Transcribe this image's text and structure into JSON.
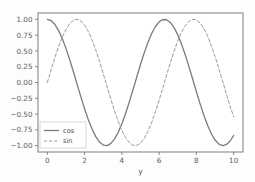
{
  "figure": {
    "background_color": "#fdfdfd",
    "axes_background_color": "#ffffff",
    "spine_color": "#6f6f6f",
    "tick_label_color": "#5b5b5b"
  },
  "chart_data": {
    "type": "line",
    "title": "",
    "xlabel": "y",
    "ylabel": "",
    "xlim": [
      -0.5,
      10.5
    ],
    "ylim": [
      -1.1,
      1.1
    ],
    "grid": false,
    "legend_position": "lower left",
    "x_ticks": [
      0,
      2,
      4,
      6,
      8,
      10
    ],
    "x_tick_labels": [
      "0",
      "2",
      "4",
      "6",
      "8",
      "10"
    ],
    "y_ticks": [
      1.0,
      0.75,
      0.5,
      0.25,
      0.0,
      -0.25,
      -0.5,
      -0.75,
      -1.0
    ],
    "y_tick_labels": [
      "1.00",
      "0.75",
      "0.50",
      "0.25",
      "0.00",
      "−0.25",
      "−0.50",
      "−0.75",
      "−1.00"
    ],
    "x": [
      0.0,
      0.2,
      0.4,
      0.6,
      0.8,
      1.0,
      1.2,
      1.4,
      1.6,
      1.8,
      2.0,
      2.2,
      2.4,
      2.6,
      2.8,
      3.0,
      3.2,
      3.4,
      3.6,
      3.8,
      4.0,
      4.2,
      4.4,
      4.6,
      4.8,
      5.0,
      5.2,
      5.4,
      5.6,
      5.8,
      6.0,
      6.2,
      6.4,
      6.6,
      6.8,
      7.0,
      7.2,
      7.4,
      7.6,
      7.8,
      8.0,
      8.2,
      8.4,
      8.6,
      8.8,
      9.0,
      9.2,
      9.4,
      9.6,
      9.8,
      10.0
    ],
    "series": [
      {
        "name": "cos",
        "label": "cos",
        "style": "solid",
        "color": "#7a7a7a",
        "linewidth": 1.3,
        "values": [
          1.0,
          0.98,
          0.921,
          0.825,
          0.697,
          0.54,
          0.362,
          0.17,
          -0.029,
          -0.227,
          -0.416,
          -0.589,
          -0.737,
          -0.857,
          -0.942,
          -0.99,
          -0.998,
          -0.967,
          -0.897,
          -0.791,
          -0.654,
          -0.49,
          -0.307,
          -0.112,
          0.087,
          0.284,
          0.469,
          0.635,
          0.776,
          0.886,
          0.96,
          0.997,
          0.993,
          0.951,
          0.869,
          0.754,
          0.608,
          0.438,
          0.251,
          0.055,
          -0.146,
          -0.338,
          -0.519,
          -0.677,
          -0.811,
          -0.911,
          -0.973,
          -0.999,
          -0.985,
          -0.93,
          -0.839
        ]
      },
      {
        "name": "sin",
        "label": "sin",
        "style": "dashed",
        "color": "#9a9a9a",
        "linewidth": 1.0,
        "values": [
          0.0,
          0.199,
          0.389,
          0.565,
          0.717,
          0.841,
          0.932,
          0.985,
          1.0,
          0.974,
          0.909,
          0.808,
          0.675,
          0.516,
          0.335,
          0.141,
          -0.058,
          -0.256,
          -0.443,
          -0.612,
          -0.757,
          -0.872,
          -0.952,
          -0.994,
          -0.996,
          -0.959,
          -0.883,
          -0.773,
          -0.631,
          -0.465,
          -0.279,
          -0.083,
          0.117,
          0.311,
          0.495,
          0.657,
          0.794,
          0.899,
          0.968,
          0.999,
          0.989,
          0.941,
          0.855,
          0.736,
          0.585,
          0.412,
          0.224,
          0.027,
          -0.174,
          -0.367,
          -0.544
        ]
      }
    ]
  },
  "legend": {
    "entries": [
      {
        "label": "cos",
        "style": "solid"
      },
      {
        "label": "sin",
        "style": "dashed"
      }
    ]
  }
}
